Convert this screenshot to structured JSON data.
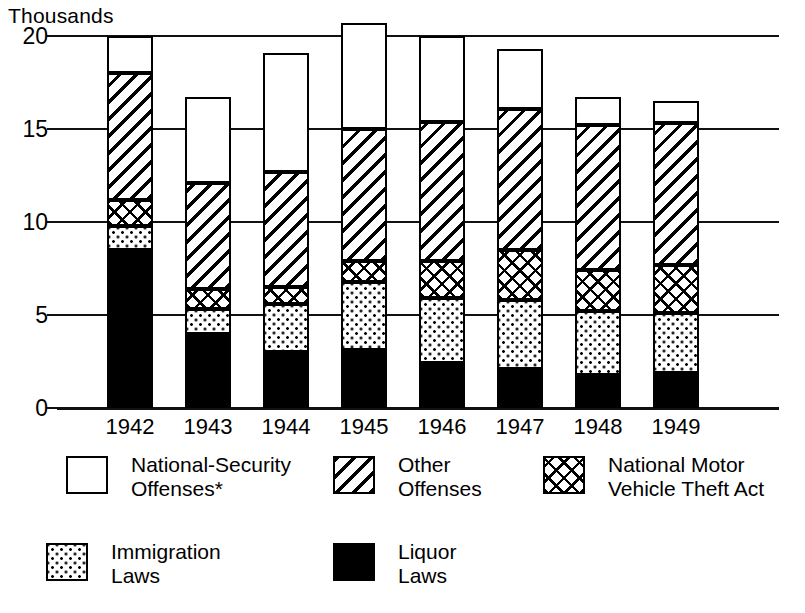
{
  "axis_title": "Thousands",
  "legend": {
    "items": [
      {
        "name": "national-security-offenses",
        "label": "National-Security\nOffenses*",
        "pattern": "white",
        "x": 66,
        "y": 4
      },
      {
        "name": "other-offenses",
        "label": "Other\nOffenses",
        "pattern": "diag",
        "x": 333,
        "y": 4
      },
      {
        "name": "national-motor-vehicle-theft-act",
        "label": "National Motor\nVehicle Theft Act",
        "pattern": "cross",
        "x": 543,
        "y": 4
      },
      {
        "name": "immigration-laws",
        "label": "Immigration\nLaws",
        "pattern": "dots",
        "x": 46,
        "y": 91
      },
      {
        "name": "liquor-laws",
        "label": "Liquor\nLaws",
        "pattern": "black",
        "x": 333,
        "y": 91
      }
    ]
  },
  "chart_data": {
    "type": "bar",
    "title": "",
    "subtitle": "",
    "xlabel": "",
    "ylabel": "Thousands",
    "ylim": [
      0,
      20
    ],
    "yticks": [
      0,
      5,
      10,
      15,
      20
    ],
    "grid": true,
    "stacked": true,
    "legend_position": "bottom",
    "categories": [
      "1942",
      "1943",
      "1944",
      "1945",
      "1946",
      "1947",
      "1948",
      "1949"
    ],
    "series": [
      {
        "name": "Liquor Laws",
        "pattern": "black",
        "values": [
          8.5,
          4.0,
          3.0,
          3.1,
          2.4,
          2.1,
          1.8,
          1.9
        ]
      },
      {
        "name": "Immigration Laws",
        "pattern": "dots",
        "values": [
          1.3,
          1.3,
          2.6,
          3.7,
          3.5,
          3.7,
          3.4,
          3.2
        ]
      },
      {
        "name": "National Motor Vehicle Theft Act",
        "pattern": "cross",
        "values": [
          1.4,
          1.1,
          0.9,
          1.1,
          2.0,
          2.7,
          2.2,
          2.6
        ]
      },
      {
        "name": "Other Offenses",
        "pattern": "diag",
        "values": [
          6.8,
          5.7,
          6.2,
          7.1,
          7.5,
          7.6,
          7.8,
          7.6
        ]
      },
      {
        "name": "National-Security Offenses",
        "pattern": "white",
        "values": [
          2.0,
          4.6,
          6.4,
          5.7,
          4.6,
          3.2,
          1.5,
          1.2
        ]
      }
    ],
    "totals": [
      20.0,
      16.7,
      19.1,
      20.7,
      20.0,
      19.3,
      16.7,
      16.5
    ]
  }
}
